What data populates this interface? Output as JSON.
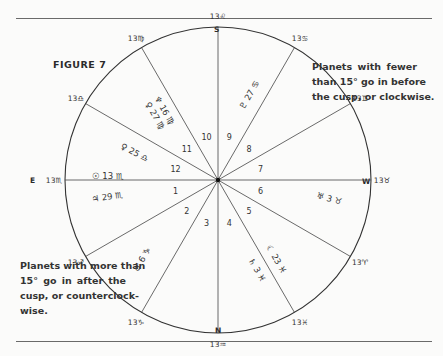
{
  "figure_title": "FIGURE 7",
  "compass": {
    "south": "S",
    "north": "N",
    "east": "E",
    "west": "W"
  },
  "note_top": {
    "lines": [
      "Planets with fewer",
      "than 15° go in before",
      "the cusp, or clockwise."
    ]
  },
  "note_bottom": {
    "lines": [
      "Planets with more than",
      "15° go in after the",
      "cusp, or counterclock-",
      "wise."
    ]
  },
  "chart": {
    "center": [
      218,
      180
    ],
    "radius": 153,
    "cusps": [
      {
        "label": "13♏",
        "angle": 180
      },
      {
        "label": "13♐",
        "angle": 210
      },
      {
        "label": "13♑",
        "angle": 240
      },
      {
        "label": "13♒",
        "angle": 270
      },
      {
        "label": "13♓",
        "angle": 300
      },
      {
        "label": "13♈",
        "angle": 330
      },
      {
        "label": "13♉",
        "angle": 0
      },
      {
        "label": "13♊",
        "angle": 30
      },
      {
        "label": "13♋",
        "angle": 60
      },
      {
        "label": "13♌",
        "angle": 90
      },
      {
        "label": "13♍",
        "angle": 120
      },
      {
        "label": "13♎",
        "angle": 150
      }
    ],
    "houses": [
      "1",
      "2",
      "3",
      "4",
      "5",
      "6",
      "7",
      "8",
      "9",
      "10",
      "11",
      "12"
    ],
    "planets": [
      {
        "text": "☉ 13 ♏",
        "house": 12
      },
      {
        "text": "♃ 29 ♏",
        "house": 1
      },
      {
        "text": "♂ 6 ♑",
        "house": 2
      },
      {
        "text": "☾ 23 ♓",
        "house": 5
      },
      {
        "text": "♄ 3 ♓",
        "house": 5
      },
      {
        "text": "♅ 3 ♉",
        "house": 6
      },
      {
        "text": "♇ 27 ♋",
        "house": 9
      },
      {
        "text": "♀ 27 ♍",
        "house": 11
      },
      {
        "text": "♆ 16 ♍",
        "house": 11
      },
      {
        "text": "♀ 25 ♎",
        "house": 12
      }
    ]
  }
}
